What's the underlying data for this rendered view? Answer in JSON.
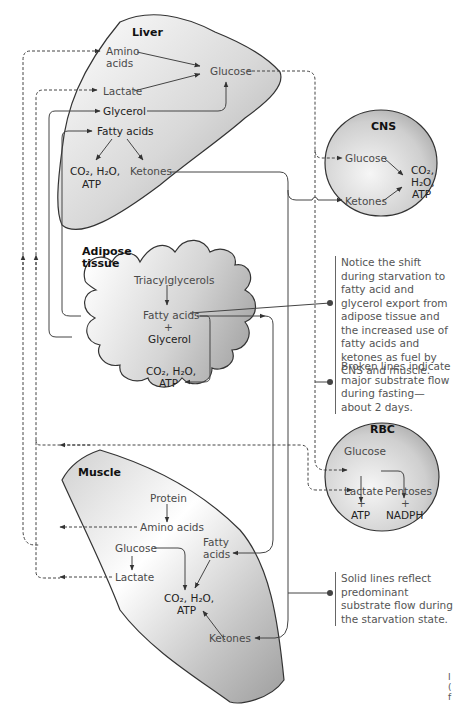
{
  "organs": {
    "liver": {
      "title": "Liver",
      "amino_acids": "Amino\nacids",
      "amino_l1": "Amino",
      "amino_l2": "acids",
      "glucose": "Glucose",
      "lactate": "Lactate",
      "glycerol": "Glycerol",
      "fatty_acids": "Fatty acids",
      "co2_l1": "CO₂, H₂O,",
      "co2_l2": "ATP",
      "ketones": "Ketones"
    },
    "cns": {
      "title": "CNS",
      "glucose": "Glucose",
      "ketones": "Ketones",
      "co2_l1": "CO₂,",
      "co2_l2": "H₂O,",
      "co2_l3": "ATP"
    },
    "adipose": {
      "title_l1": "Adipose",
      "title_l2": "tissue",
      "triacylglycerols": "Triacylglycerols",
      "fatty_acids": "Fatty acids",
      "plus": "+",
      "glycerol": "Glycerol",
      "co2_l1": "CO₂, H₂O,",
      "co2_l2": "ATP"
    },
    "rbc": {
      "title": "RBC",
      "glucose": "Glucose",
      "lactate": "Lactate",
      "pentoses": "Pentoses",
      "plus1": "+",
      "plus2": "+",
      "atp": "ATP",
      "nadph": "NADPH"
    },
    "muscle": {
      "title": "Muscle",
      "protein": "Protein",
      "amino_acids": "Amino acids",
      "glucose": "Glucose",
      "lactate": "Lactate",
      "fatty_l1": "Fatty",
      "fatty_l2": "acids",
      "co2_l1": "CO₂, H₂O,",
      "co2_l2": "ATP",
      "ketones": "Ketones"
    }
  },
  "notes": {
    "shift": "Notice the shift during starvation to fatty acid and glycerol export from adipose tissue and the increased use of fatty acids and ketones as fuel by CNS and muscle.",
    "broken": "Broken lines indicate major substrate flow during fasting—about 2 days.",
    "solid": "Solid lines reflect predominant substrate flow during the starvation state."
  },
  "fragment": {
    "l1": "I",
    "l2": "(",
    "l3": "f"
  },
  "colors": {
    "organ_fill_dark": "#b5b5b5",
    "organ_fill_light": "#f2f2f2",
    "line": "#444444",
    "text": "#4a4a4a"
  }
}
